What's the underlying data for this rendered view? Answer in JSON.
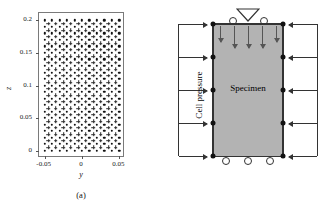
{
  "figure": {
    "panel_a": {
      "caption": "(a)",
      "axis_title_y": "y",
      "axis_title_z": "z",
      "x_ticks": [
        "-0.05",
        "0",
        "0.05"
      ],
      "x_tick_values": [
        -0.05,
        0,
        0.05
      ],
      "y_ticks": [
        "0",
        "0.05",
        "0.1",
        "0.15",
        "0.2"
      ],
      "y_tick_values": [
        0,
        0.05,
        0.1,
        0.15,
        0.2
      ]
    },
    "panel_b": {
      "caption": "(b)",
      "specimen_label": "Specimen",
      "pressure_label": "Cell pressure",
      "load_symbol": "inverted-triangle-load-icon",
      "specimen_fill_color": "#b3b3b3",
      "node_color": "#111111",
      "left_arrow_count": 5,
      "right_arrow_count": 5,
      "axial_arrow_count": 5,
      "top_roller_count": 2,
      "bottom_roller_count": 3,
      "left_node_count": 5,
      "right_node_count": 5
    }
  },
  "chart_data": {
    "type": "scatter",
    "title": "",
    "xlabel": "y",
    "ylabel": "z",
    "xlim": [
      -0.0575,
      0.0575
    ],
    "ylim": [
      -0.0115,
      0.2115
    ],
    "grid": false,
    "legend": null,
    "series": [
      {
        "name": "mesh nodes",
        "marker": "dot",
        "nx": 11,
        "ny": 21,
        "x_start": -0.05,
        "x_step": 0.01,
        "y_start": 0.0,
        "y_step": 0.01
      },
      {
        "name": "integration points",
        "marker": "cross",
        "nx": 10,
        "ny": 20,
        "x_start": -0.045,
        "x_step": 0.01,
        "y_start": 0.005,
        "y_step": 0.01
      }
    ]
  }
}
